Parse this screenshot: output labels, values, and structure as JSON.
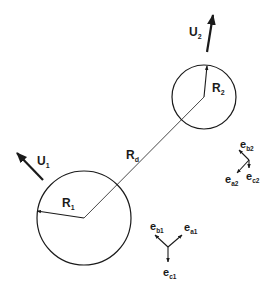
{
  "diagram": {
    "type": "two-sphere geometry with velocity vectors and local basis triads",
    "colors": {
      "stroke": "#1a1a1a",
      "background": "#ffffff"
    },
    "spheres": [
      {
        "id": "sphere-1",
        "center": [
          84,
          218
        ],
        "radius": 47,
        "radius_label": {
          "main": "R",
          "sub": "1"
        },
        "velocity_label": {
          "main": "U",
          "sub": "1"
        }
      },
      {
        "id": "sphere-2",
        "center": [
          204,
          97
        ],
        "radius": 32,
        "radius_label": {
          "main": "R",
          "sub": "2"
        },
        "velocity_label": {
          "main": "U",
          "sub": "2"
        }
      }
    ],
    "separation_label": {
      "main": "R",
      "sub": "d"
    },
    "triad_1": {
      "a": {
        "main": "e",
        "sub": "a1"
      },
      "b": {
        "main": "e",
        "sub": "b1"
      },
      "c": {
        "main": "e",
        "sub": "c1"
      }
    },
    "triad_2": {
      "a": {
        "main": "e",
        "sub": "a2"
      },
      "b": {
        "main": "e",
        "sub": "b2"
      },
      "c": {
        "main": "e",
        "sub": "c2"
      }
    }
  }
}
